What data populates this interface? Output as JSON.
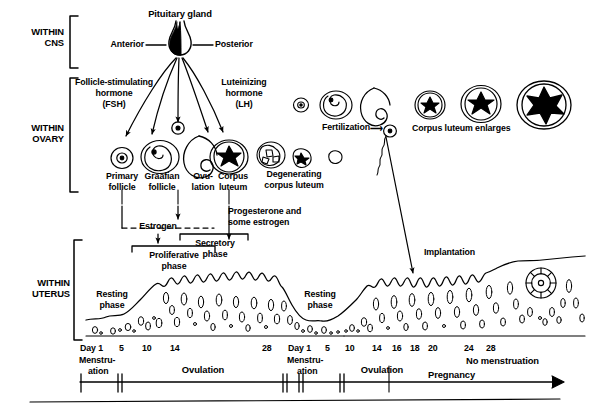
{
  "figure": {
    "ink_color": "#000000",
    "background_color": "#ffffff"
  },
  "row_labels": [
    {
      "id": "cns",
      "line1": "WITHIN",
      "line2": "CNS"
    },
    {
      "id": "ovary",
      "line1": "WITHIN",
      "line2": "OVARY"
    },
    {
      "id": "uterus",
      "line1": "WITHIN",
      "line2": "UTERUS"
    }
  ],
  "cns": {
    "gland_label": "Pituitary gland",
    "anterior_label": "Anterior",
    "posterior_label": "Posterior"
  },
  "ovary": {
    "fsh": {
      "line1": "Follicle-stimulating",
      "line2": "hormone",
      "line3": "(FSH)"
    },
    "lh": {
      "line1": "Luteinizing",
      "line2": "hormone",
      "line3": "(LH)"
    },
    "stages": [
      {
        "id": "primary-follicle",
        "line1": "Primary",
        "line2": "follicle"
      },
      {
        "id": "graafian-follicle",
        "line1": "Graafian",
        "line2": "follicle"
      },
      {
        "id": "ovulation",
        "line1": "Ovu-",
        "line2": "lation"
      },
      {
        "id": "corpus-luteum",
        "line1": "Corpus",
        "line2": "luteum"
      }
    ],
    "degenerating": {
      "line1": "Degenerating",
      "line2": "corpus luteum"
    },
    "fertilization_label": "Fertilization",
    "corpus_luteum_enlarges_label": "Corpus luteum enlarges"
  },
  "uterus": {
    "hormones": {
      "estrogen": "Estrogen",
      "progesterone_line1": "Progesterone and",
      "progesterone_line2": "some estrogen"
    },
    "phases": [
      {
        "id": "proliferative",
        "line1": "Proliferative",
        "line2": "phase"
      },
      {
        "id": "secretory",
        "line1": "Secretory",
        "line2": "phase"
      }
    ],
    "resting_phase": {
      "line1": "Resting",
      "line2": "phase"
    },
    "implantation_label": "Implantation"
  },
  "timeline": {
    "cycle1": {
      "days": [
        "Day 1",
        "5",
        "10",
        "14",
        "28"
      ],
      "menstruation_line1": "Menstru-",
      "menstruation_line2": "ation",
      "ovulation_label": "Ovulation"
    },
    "cycle2": {
      "days": [
        "Day 1",
        "5",
        "10",
        "14",
        "16",
        "18",
        "20",
        "24",
        "28"
      ],
      "menstruation_line1": "Menstru-",
      "menstruation_line2": "ation",
      "ovulation_label": "Ovulation",
      "pregnancy_label": "Pregnancy",
      "no_menstruation_label": "No menstruation"
    }
  }
}
